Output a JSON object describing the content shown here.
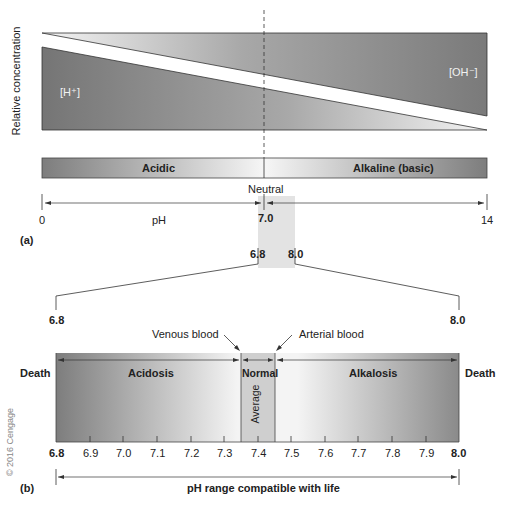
{
  "panel_a": {
    "label": "(a)",
    "y_axis_label": "Relative concentration",
    "h_label": "[H⁺]",
    "oh_label": "[OH⁻]",
    "acidic_label": "Acidic",
    "alkaline_label": "Alkaline (basic)",
    "neutral_label": "Neutral",
    "scale": {
      "min": "0",
      "mid": "7.0",
      "max": "14",
      "axis_label": "pH"
    },
    "zoom_range": {
      "low": "6.8",
      "high": "8.0"
    }
  },
  "panel_b": {
    "label": "(b)",
    "left_value": "6.8",
    "right_value": "8.0",
    "venous_label": "Venous blood",
    "arterial_label": "Arterial blood",
    "death_left": "Death",
    "death_right": "Death",
    "acidosis_label": "Acidosis",
    "normal_label": "Normal",
    "alkalosis_label": "Alkalosis",
    "average_label": "Average",
    "ticks": [
      "6.8",
      "6.9",
      "7.0",
      "7.1",
      "7.2",
      "7.3",
      "7.4",
      "7.5",
      "7.6",
      "7.7",
      "7.8",
      "7.9",
      "8.0"
    ],
    "range_label": "pH range compatible with life"
  },
  "copyright": "© 2016 Cengage",
  "colors": {
    "dark_gray": "#7a7a7a",
    "light_gray": "#f2f2f2",
    "highlight": "#e3e3e3",
    "line": "#333333"
  }
}
